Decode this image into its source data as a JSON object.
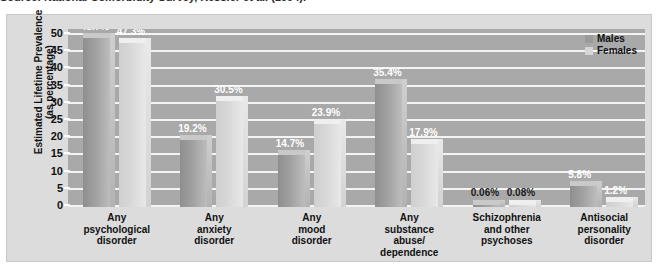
{
  "caption": "Source: National Comorbidity Survey, Kessler et al. (1994).",
  "legend": {
    "position": "top-right",
    "entries": [
      {
        "label": "Males",
        "swatch": "male-swatch",
        "color": "#9a9a9a"
      },
      {
        "label": "Females",
        "swatch": "female-swatch",
        "color": "#d6d6d6"
      }
    ]
  },
  "axis": {
    "ylabel_line1": "Estimated Lifetime Prevalence",
    "ylabel_line2": "(as percentage)",
    "yticks": [
      "50",
      "45",
      "40",
      "35",
      "30",
      "25",
      "20",
      "15",
      "10",
      "5",
      "0"
    ]
  },
  "chart_data": {
    "type": "bar",
    "title": "",
    "xlabel": "",
    "ylabel": "Estimated Lifetime Prevalence (as percentage)",
    "ylim": [
      0,
      50
    ],
    "ytick_step": 5,
    "grid": true,
    "legend_position": "top-right",
    "categories": [
      "Any\npsychological\ndisorder",
      "Any\nanxiety\ndisorder",
      "Any\nmood\ndisorder",
      "Any\nsubstance\nabuse/\ndependence",
      "Schizophrenia\nand other\npsychoses",
      "Antisocial\npersonality\ndisorder"
    ],
    "series": [
      {
        "name": "Males",
        "values": [
          48.7,
          19.2,
          14.7,
          35.4,
          0.06,
          5.8
        ],
        "labels": [
          "48.7%",
          "19.2%",
          "14.7%",
          "35.4%",
          "0.06%",
          "5.8%"
        ]
      },
      {
        "name": "Females",
        "values": [
          47.3,
          30.5,
          23.9,
          17.9,
          0.08,
          1.2
        ],
        "labels": [
          "47.3%",
          "30.5%",
          "23.9%",
          "17.9%",
          "0.08%",
          "1.2%"
        ]
      }
    ]
  },
  "colors": {
    "panel_background": "#dcdcdc",
    "plot_background": "#a9a9a9",
    "gridline": "#f4f4f4",
    "male_bar": "#9a9a9a",
    "female_bar": "#d6d6d6",
    "value_label": "#ffffff"
  }
}
